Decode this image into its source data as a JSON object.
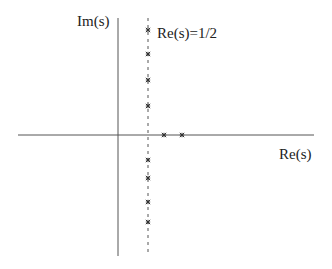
{
  "diagram": {
    "type": "complex-plane",
    "labels": {
      "imag_axis": "Im(s)",
      "real_axis": "Re(s)",
      "critical_line": "Re(s)=1/2"
    },
    "colors": {
      "axis": "#555555",
      "dashed_line": "#555555",
      "marker": "#333333",
      "text": "#222222"
    },
    "geometry": {
      "origin": {
        "x": 118,
        "y": 135
      },
      "real_axis_extent": [
        18,
        314
      ],
      "imag_axis_extent": [
        18,
        256
      ],
      "critical_line_x": 148,
      "critical_line_extent": [
        18,
        254
      ]
    },
    "markers": {
      "on_critical_line_y": [
        30,
        54,
        80,
        106,
        160,
        178,
        202,
        222
      ],
      "on_real_axis_x": [
        164,
        182
      ]
    }
  }
}
